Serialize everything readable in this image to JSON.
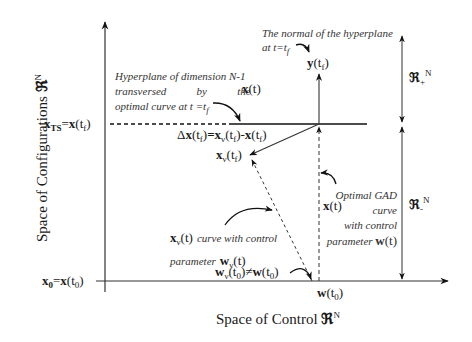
{
  "axes": {
    "y_label": "Space of Configurations ℜᴺ",
    "x_label": "Space of Control ℜᴺ"
  },
  "labels": {
    "x_ts": "x_TS=x(t_f)",
    "x_0": "x_0=x(t_0)",
    "w_t0": "w(t_0)",
    "y_tf": "y(t_f)",
    "delta": "Δx(t_f)=x_ν(t_f)-x(t_f)",
    "xv_tf": "x_ν(t_f)",
    "x_t": "x(t)",
    "r_plus": "ℜ_+^N",
    "r_minus": "ℜ_-^N",
    "wv_neq": "w_ν(t_0)≠w(t_0)"
  },
  "annotations": {
    "hyperplane": [
      "Hyperplane of dimension N-1",
      "transversed by the",
      "optimal curve at t =t_f"
    ],
    "hyperplane_x": "x(t)",
    "normal": [
      "The normal of the hyperplane",
      "at t=t_f"
    ],
    "optimal": [
      "Optimal GAD",
      "curve",
      "with control",
      "parameter"
    ],
    "optimal_w": "w(t)",
    "xv_curve": [
      "curve with control",
      "parameter"
    ],
    "xv_curve_w": "w_ν(t)"
  },
  "strings": {
    "space_conf": "Space of Configurations",
    "space_ctrl": "Space of Control",
    "R": "ℜ",
    "N": "N",
    "x": "x",
    "TS": "TS",
    "eq": "=",
    "t": "t",
    "f": "f",
    "zero": "0",
    "y": "y",
    "w": "w",
    "nu": "ν",
    "Delta": "Δ",
    "minus": "-",
    "neq": "≠",
    "plus": "+",
    "dash": "-",
    "hyp1": "Hyperplane of dimension N-1",
    "hyp2a": "transversed",
    "hyp2b": "by",
    "hyp2c": "the",
    "hyp3": "optimal curve at t =t",
    "norm1": "The normal of the hyperplane",
    "norm2": "at t=t",
    "opt1": "Optimal GAD",
    "opt2": "curve",
    "opt3": "with control",
    "opt4": "parameter",
    "xv1": "curve with control",
    "xv2": "parameter"
  }
}
